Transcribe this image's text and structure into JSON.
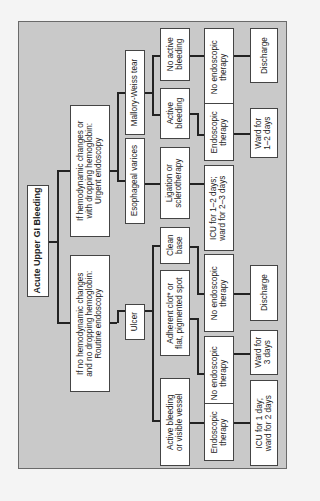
{
  "diagram": {
    "title": "Acute Upper GI Bleeding",
    "level1": {
      "urgent": "If hemodynamic changes or\nwith dropping hemoglobin:\nUrgent endoscopy",
      "routine": "If no hemodynamic changes\nand no dropping hemoglobin:\nRoutine endoscopy"
    },
    "level2": {
      "mallory_weiss": "Mallory-Weiss tear",
      "varices": "Esophageal varices",
      "ulcer": "Ulcer"
    },
    "level3": {
      "mw_no_active": "No active\nbleeding",
      "mw_active": "Active\nbleeding",
      "varices_ligation": "Ligation or\nsclerotherapy",
      "ulcer_clean": "Clean\nbase",
      "ulcer_adherent": "Adherent clot* or\nflat, pigmented spot",
      "ulcer_active": "Active bleeding\nor visible vessel"
    },
    "level4": {
      "mw_no_endo": "No endoscopic\ntherapy",
      "mw_endo": "Endoscopic\ntherapy",
      "varices_icu": "ICU for 1–2 days;\nward for 2–3 days",
      "clean_no_endo": "No endoscopic\ntherapy",
      "adherent_no_endo": "No endoscopic\ntherapy",
      "active_endo": "Endoscopic\ntherapy"
    },
    "level5": {
      "mw_discharge": "Discharge",
      "mw_ward": "Ward for\n1–2 days",
      "clean_discharge": "Discharge",
      "adherent_ward": "Ward for\n3 days",
      "active_icu": "ICU for 1 day;\nward for 2 days"
    },
    "colors": {
      "panel": "#c9c9c9",
      "box": "#ffffff",
      "line": "#222222",
      "page": "#f4f4f4"
    }
  }
}
